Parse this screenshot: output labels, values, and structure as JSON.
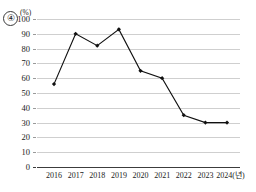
{
  "item_number": "④",
  "unit_label": "(%)",
  "chart_data": {
    "type": "line",
    "title": "",
    "subtitle": "",
    "xlabel": "",
    "ylabel": "(%)",
    "x_axis_suffix": "(년)",
    "categories": [
      "2016",
      "2017",
      "2018",
      "2019",
      "2020",
      "2021",
      "2022",
      "2023",
      "2024"
    ],
    "x_tick_labels": [
      "2016",
      "2017",
      "2018",
      "2019",
      "2020",
      "2021",
      "2022",
      "2023",
      "2024(년)"
    ],
    "values": [
      56,
      90,
      82,
      93,
      65,
      60,
      35,
      30,
      30
    ],
    "y_tick_labels": [
      "0",
      "10",
      "20",
      "30",
      "40",
      "50",
      "60",
      "70",
      "80",
      "90",
      "100"
    ],
    "y_ticks": [
      0,
      10,
      20,
      30,
      40,
      50,
      60,
      70,
      80,
      90,
      100
    ],
    "ylim": [
      0,
      100
    ],
    "grid": true,
    "grid_axis": "y",
    "legend": false,
    "legend_position": "none",
    "marker": "diamond",
    "line_color": "#111111",
    "grid_color": "#cfcfcf",
    "axis_color": "#3c3c3c",
    "background_color": "#ffffff"
  }
}
